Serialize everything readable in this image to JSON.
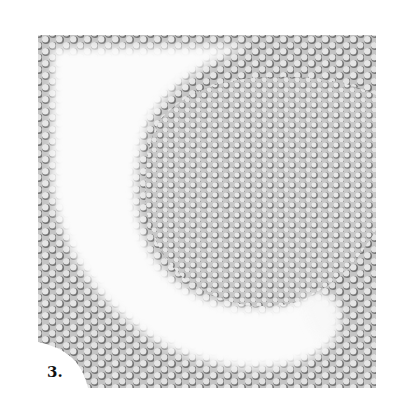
{
  "figure": {
    "label": "3.",
    "colors": {
      "background": "#ffffff",
      "texture_base": "#b8b8b8",
      "cell_shadow": "#6e6e6e",
      "cell_highlight": "#efefef",
      "clear_zone": "#fbfbfb",
      "label": "#111111"
    }
  }
}
